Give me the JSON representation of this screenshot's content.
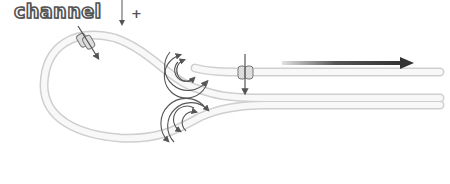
{
  "labels": {
    "channel": "channel",
    "plus": "+"
  },
  "colors": {
    "fiber_outline": "#cfcfcf",
    "fiber_fill": "#f7f7f7",
    "arrow": "#555555",
    "flow_arrow_dark": "#333333",
    "flow_arrow_light": "#d8d8d8",
    "text_outline": "#555555"
  },
  "icons": {
    "channel_left": "ion-channel-icon",
    "channel_right": "ion-channel-icon",
    "current_upper": "circular-current-arrows-icon",
    "current_lower": "circular-current-arrows-icon",
    "flow": "flow-direction-arrow-icon"
  }
}
